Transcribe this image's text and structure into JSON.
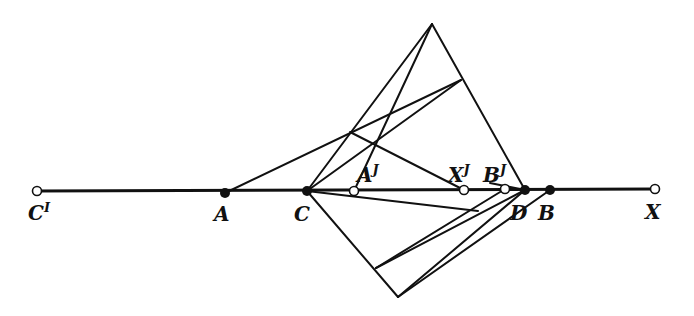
{
  "figure": {
    "type": "geometric-construction",
    "points_on_line": [
      {
        "id": "C_prime",
        "label": "C",
        "sup": "I",
        "style": "open",
        "x": 37,
        "y": 191,
        "lx": 28,
        "ly": 220
      },
      {
        "id": "A",
        "label": "A",
        "sup": "",
        "style": "filled",
        "x": 225,
        "y": 193,
        "lx": 214,
        "ly": 221
      },
      {
        "id": "C",
        "label": "C",
        "sup": "",
        "style": "filled",
        "x": 307,
        "y": 191,
        "lx": 294,
        "ly": 221
      },
      {
        "id": "A_prime",
        "label": "A",
        "sup": "J",
        "style": "open",
        "x": 354,
        "y": 191,
        "lx": 357,
        "ly": 182
      },
      {
        "id": "X_prime",
        "label": "X",
        "sup": "J",
        "style": "open",
        "x": 464,
        "y": 190,
        "lx": 448,
        "ly": 182
      },
      {
        "id": "B_prime",
        "label": "B",
        "sup": "J",
        "style": "open",
        "x": 505,
        "y": 189,
        "lx": 483,
        "ly": 182
      },
      {
        "id": "D",
        "label": "D",
        "sup": "",
        "style": "filled",
        "x": 525,
        "y": 190,
        "lx": 510,
        "ly": 220
      },
      {
        "id": "B",
        "label": "B",
        "sup": "",
        "style": "filled",
        "x": 550,
        "y": 190,
        "lx": 538,
        "ly": 220
      },
      {
        "id": "X",
        "label": "X",
        "sup": "",
        "style": "open",
        "x": 655,
        "y": 189,
        "lx": 645,
        "ly": 219
      }
    ],
    "construction_points": {
      "P_top": {
        "x": 432,
        "y": 24
      },
      "Q_right": {
        "x": 461,
        "y": 80
      },
      "R": {
        "x": 350,
        "y": 132
      },
      "S": {
        "x": 377,
        "y": 141
      },
      "L_bottom": {
        "x": 398,
        "y": 297
      },
      "M": {
        "x": 376,
        "y": 268
      },
      "N": {
        "x": 478,
        "y": 211
      }
    },
    "segments": [
      [
        307,
        191,
        432,
        24
      ],
      [
        432,
        24,
        525,
        190
      ],
      [
        354,
        191,
        432,
        24
      ],
      [
        225,
        193,
        461,
        80
      ],
      [
        307,
        191,
        461,
        80
      ],
      [
        350,
        132,
        464,
        190
      ],
      [
        307,
        191,
        398,
        297
      ],
      [
        398,
        297,
        525,
        190
      ],
      [
        398,
        297,
        550,
        190
      ],
      [
        376,
        268,
        525,
        190
      ],
      [
        376,
        268,
        505,
        189
      ],
      [
        307,
        191,
        478,
        211
      ],
      [
        490,
        183,
        525,
        190
      ]
    ]
  }
}
